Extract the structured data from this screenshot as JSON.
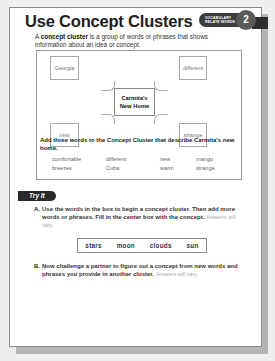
{
  "header": {
    "title": "Use Concept Clusters",
    "badge_line1": "VOCABULARY",
    "badge_line2": "RELATE WORDS",
    "badge_number": "2"
  },
  "intro": {
    "term": "concept cluster",
    "prefix": "A ",
    "suffix": " is a group of words or phrases that shows information about an idea or concept."
  },
  "cluster": {
    "center_line1": "Carmita's",
    "center_line2": "New Home",
    "nodes": [
      "Georgia",
      "different",
      "new",
      "strange"
    ]
  },
  "activity": {
    "instruction": "Add three words to the Concept Cluster that describe Carmita's new home.",
    "words": [
      "comfortable",
      "different",
      "new",
      "mango",
      "breezes",
      "Cuba",
      "warm",
      "strange"
    ]
  },
  "try_it": {
    "label": "Try It",
    "question_a": {
      "letter": "A.",
      "text": "Use the words in the box to begin a concept cluster. Then add more words or phrases. Fill in the center box with the concept.",
      "note": "Answers will vary."
    },
    "word_box": [
      "stars",
      "moon",
      "clouds",
      "sun"
    ],
    "question_b": {
      "letter": "B.",
      "text": "Now challenge a partner to figure out a concept from new words and phrases you provide in another cluster.",
      "note": "Answers will vary."
    }
  },
  "colors": {
    "badge_dark": "#3b3b3b",
    "circle": "#5a5a5a",
    "tab": "#2a2a2a",
    "border": "#8a8a8a"
  }
}
